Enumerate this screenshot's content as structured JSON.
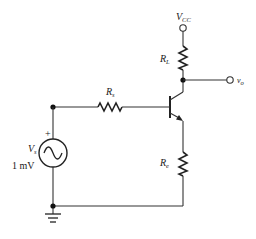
{
  "diagram": {
    "type": "circuit-schematic",
    "components": {
      "supply": {
        "label": "V",
        "subscript": "CC"
      },
      "load_resistor": {
        "label": "R",
        "subscript": "L"
      },
      "source_resistor": {
        "label": "R",
        "subscript": "s"
      },
      "emitter_resistor": {
        "label": "R",
        "subscript": "e"
      },
      "source": {
        "label": "V",
        "subscript": "s",
        "value": "1 mV",
        "polarity": "+"
      },
      "output": {
        "label": "v",
        "subscript": "o"
      },
      "transistor": {
        "type": "NPN BJT"
      },
      "ground": {
        "symbol": "ground"
      }
    },
    "colors": {
      "wire": "#333333",
      "background": "#ffffff"
    }
  }
}
